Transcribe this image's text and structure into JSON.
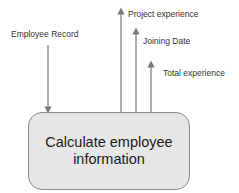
{
  "diagram": {
    "process": {
      "line1": "Calculate employee",
      "line2": "information"
    },
    "inputs": [
      {
        "label": "Employee Record"
      }
    ],
    "outputs": [
      {
        "label": "Project experience"
      },
      {
        "label": "Joining Date"
      },
      {
        "label": "Total experience"
      }
    ],
    "colors": {
      "box_fill": "#e6e6e6",
      "box_border": "#8a8a8a",
      "arrow": "#7a7a7a",
      "text": "#333333"
    }
  }
}
